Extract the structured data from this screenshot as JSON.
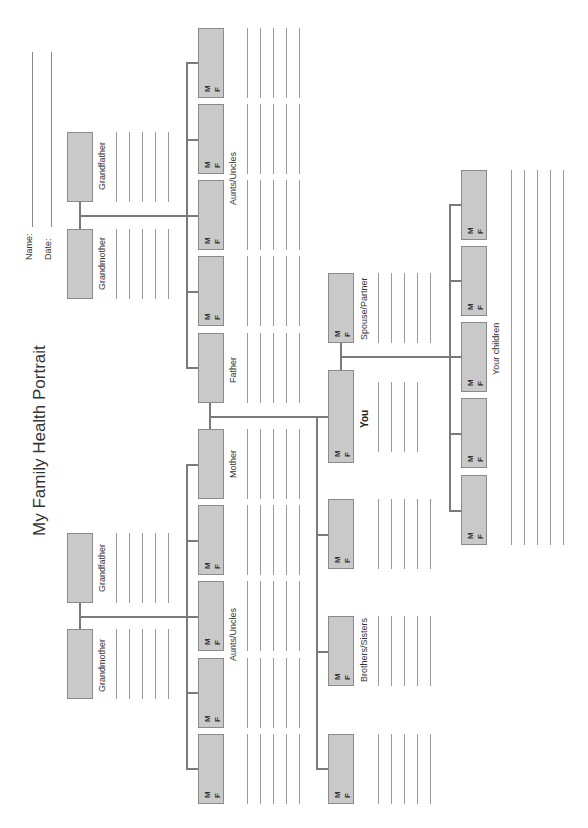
{
  "page": {
    "title": "My Family Health Portrait",
    "name_label": "Name:",
    "date_label": "Date:"
  },
  "sex_markers": {
    "male": "M",
    "female": "F"
  },
  "paternal_grandparents": {
    "grandmother": "Grandmother",
    "grandfather": "Grandfather"
  },
  "maternal_grandparents": {
    "grandmother": "Grandmother",
    "grandfather": "Grandfather"
  },
  "paternal_aunts_uncles": {
    "label": "Aunts/Uncles",
    "count": 4
  },
  "maternal_aunts_uncles": {
    "label": "Aunts/Uncles",
    "count": 4
  },
  "parents": {
    "father": "Father",
    "mother": "Mother"
  },
  "self": {
    "label": "You"
  },
  "spouse": {
    "label": "Spouse/Partner"
  },
  "siblings": {
    "label": "Brothers/Sisters",
    "count": 3
  },
  "children": {
    "label": "Your children",
    "count": 5
  }
}
